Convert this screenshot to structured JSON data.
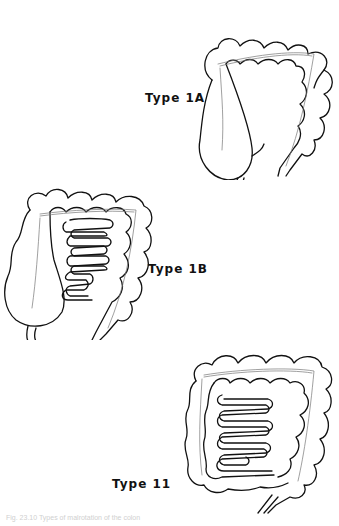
{
  "figure": {
    "panels": [
      {
        "id": "type-1a",
        "label": "Type 1A"
      },
      {
        "id": "type-1b",
        "label": "Type 1B"
      },
      {
        "id": "type-11",
        "label": "Type 11"
      }
    ],
    "caption": "Fig. 23.10 Types of malrotation of the colon"
  },
  "colors": {
    "line": "#111111",
    "background": "#ffffff",
    "caption": "#d0d0d0"
  }
}
